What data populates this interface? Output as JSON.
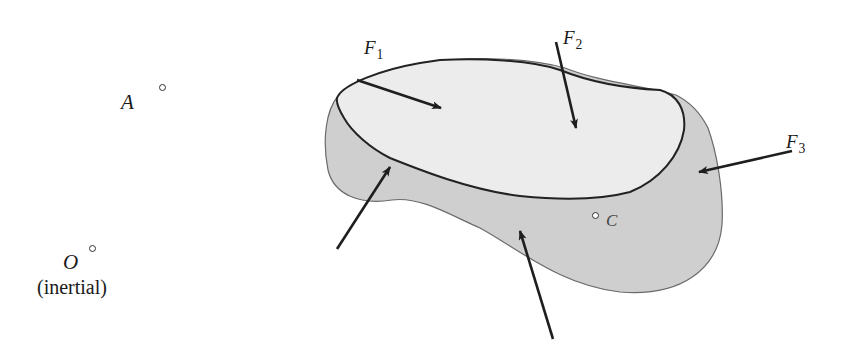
{
  "diagram": {
    "type": "free-body diagram of a rigid body",
    "colors": {
      "body_fill": "#cfcfcf",
      "top_face_fill": "#ececec",
      "outline": "#222222",
      "arrow": "#1e1e1e"
    },
    "points": {
      "A": {
        "label": "A"
      },
      "O": {
        "label": "O",
        "note": "(inertial)"
      },
      "C": {
        "label": "C"
      }
    },
    "forces": [
      {
        "id": "F1",
        "symbol": "F",
        "subscript": "1"
      },
      {
        "id": "F2",
        "symbol": "F",
        "subscript": "2"
      },
      {
        "id": "F3",
        "symbol": "F",
        "subscript": "3"
      },
      {
        "id": "unlabeled-left",
        "symbol": "",
        "subscript": ""
      },
      {
        "id": "unlabeled-bottom",
        "symbol": "",
        "subscript": ""
      }
    ]
  }
}
